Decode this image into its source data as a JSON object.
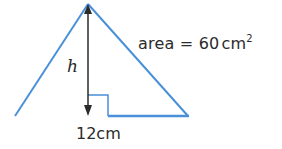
{
  "diagram": {
    "shape": "triangle",
    "colors": {
      "outline": "#4a90d9",
      "height_arrow": "#2b2b2b",
      "text": "#2b2b2b"
    },
    "labels": {
      "area_prefix": "area = 60",
      "area_unit": "cm",
      "area_exponent": "2",
      "height": "h",
      "base": "12cm"
    }
  }
}
